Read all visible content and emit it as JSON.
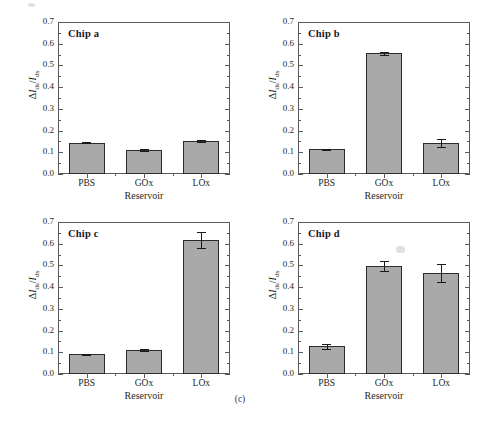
{
  "figure": {
    "subcaption": "(c)",
    "axis_title_x": "Reservoir",
    "axis_title_y_delta": "Δ",
    "axis_title_y_i1": "I",
    "axis_title_y_sub1": "ds",
    "axis_title_y_slash": "/",
    "axis_title_y_i2": "I",
    "axis_title_y_sub2": "ds",
    "bar_fill_color": "#a9a9a9",
    "bar_edge_color": "#2b2b2b",
    "axis_color": "#58595b"
  },
  "chart_data": [
    {
      "type": "bar",
      "title": "Chip a",
      "xlabel": "Reservoir",
      "ylabel": "ΔIds/Ids",
      "categories": [
        "PBS",
        "GOx",
        "LOx"
      ],
      "values": [
        0.145,
        0.11,
        0.152
      ],
      "errors": [
        0.004,
        0.004,
        0.006
      ],
      "ylim": [
        0.0,
        0.7
      ],
      "yticks": [
        0.0,
        0.1,
        0.2,
        0.3,
        0.4,
        0.5,
        0.6,
        0.7
      ],
      "ytick_labels": [
        "0.0",
        "0.1",
        "0.2",
        "0.3",
        "0.4",
        "0.5",
        "0.6",
        "0.7"
      ],
      "grid": false,
      "legend": "none"
    },
    {
      "type": "bar",
      "title": "Chip b",
      "xlabel": "Reservoir",
      "ylabel": "ΔIds/Ids",
      "categories": [
        "PBS",
        "GOx",
        "LOx"
      ],
      "values": [
        0.113,
        0.555,
        0.143
      ],
      "errors": [
        0.004,
        0.008,
        0.017
      ],
      "ylim": [
        0.0,
        0.7
      ],
      "yticks": [
        0.0,
        0.1,
        0.2,
        0.3,
        0.4,
        0.5,
        0.6,
        0.7
      ],
      "ytick_labels": [
        "0.0",
        "0.1",
        "0.2",
        "0.3",
        "0.4",
        "0.5",
        "0.6",
        "0.7"
      ],
      "grid": false,
      "legend": "none"
    },
    {
      "type": "bar",
      "title": "Chip c",
      "xlabel": "Reservoir",
      "ylabel": "ΔIds/Ids",
      "categories": [
        "PBS",
        "GOx",
        "LOx"
      ],
      "values": [
        0.09,
        0.11,
        0.615
      ],
      "errors": [
        0.004,
        0.005,
        0.037
      ],
      "ylim": [
        0.0,
        0.7
      ],
      "yticks": [
        0.0,
        0.1,
        0.2,
        0.3,
        0.4,
        0.5,
        0.6,
        0.7
      ],
      "ytick_labels": [
        "0.0",
        "0.1",
        "0.2",
        "0.3",
        "0.4",
        "0.5",
        "0.6",
        "0.7"
      ],
      "grid": false,
      "legend": "none"
    },
    {
      "type": "bar",
      "title": "Chip d",
      "xlabel": "Reservoir",
      "ylabel": "ΔIds/Ids",
      "categories": [
        "PBS",
        "GOx",
        "LOx"
      ],
      "values": [
        0.128,
        0.497,
        0.465
      ],
      "errors": [
        0.012,
        0.022,
        0.042
      ],
      "ylim": [
        0.0,
        0.7
      ],
      "yticks": [
        0.0,
        0.1,
        0.2,
        0.3,
        0.4,
        0.5,
        0.6,
        0.7
      ],
      "ytick_labels": [
        "0.0",
        "0.1",
        "0.2",
        "0.3",
        "0.4",
        "0.5",
        "0.6",
        "0.7"
      ],
      "grid": false,
      "legend": "none"
    }
  ]
}
